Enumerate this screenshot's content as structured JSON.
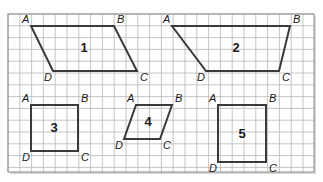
{
  "diagram": {
    "type": "grid-quadrilaterals",
    "grid": {
      "x0": 8,
      "y0": 14,
      "x1": 314,
      "y1": 172,
      "cell": 11.8,
      "line_color": "#b8b8b8",
      "border_color": "#8a8a8a"
    },
    "stroke_color": "#3a3a3a",
    "shapes": [
      {
        "number": "1",
        "kind": "parallelogram",
        "vertices": {
          "A": [
            31,
            26
          ],
          "B": [
            114,
            26
          ],
          "C": [
            137,
            71
          ],
          "D": [
            53,
            71
          ]
        },
        "label_pos": [
          84,
          52
        ]
      },
      {
        "number": "2",
        "kind": "trapezoid",
        "vertices": {
          "A": [
            172,
            26
          ],
          "B": [
            290,
            26
          ],
          "C": [
            279,
            71
          ],
          "D": [
            206,
            71
          ]
        },
        "label_pos": [
          236,
          52
        ]
      },
      {
        "number": "3",
        "kind": "square",
        "vertices": {
          "A": [
            31,
            105
          ],
          "B": [
            78,
            105
          ],
          "C": [
            78,
            151
          ],
          "D": [
            31,
            151
          ]
        },
        "label_pos": [
          54,
          132
        ]
      },
      {
        "number": "4",
        "kind": "rhombus",
        "vertices": {
          "A": [
            136,
            105
          ],
          "B": [
            172,
            105
          ],
          "C": [
            160,
            139
          ],
          "D": [
            124,
            139
          ]
        },
        "label_pos": [
          148,
          126
        ]
      },
      {
        "number": "5",
        "kind": "rectangle",
        "vertices": {
          "A": [
            218,
            105
          ],
          "B": [
            266,
            105
          ],
          "C": [
            266,
            162
          ],
          "D": [
            218,
            162
          ]
        },
        "label_pos": [
          242,
          138
        ]
      }
    ],
    "vertex_labels": [
      "A",
      "B",
      "C",
      "D"
    ]
  }
}
